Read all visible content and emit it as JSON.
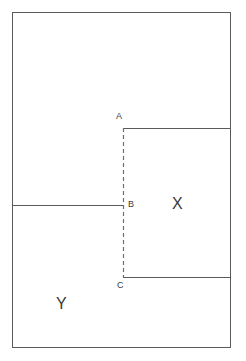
{
  "figure": {
    "canvas": {
      "width": 246,
      "height": 361
    },
    "colors": {
      "stroke": "#5a5a5a",
      "dashed_stroke": "#6e6e6e",
      "text": "#3a3a3a",
      "background": "#ffffff"
    },
    "outer_rect": {
      "x": 12,
      "y": 12,
      "width": 219,
      "height": 336
    },
    "lines": [
      {
        "name": "top-of-x",
        "x1": 123,
        "y1": 128,
        "x2": 231,
        "y2": 128,
        "style": "solid"
      },
      {
        "name": "left-divider-b",
        "x1": 12,
        "y1": 205,
        "x2": 123,
        "y2": 205,
        "style": "solid"
      },
      {
        "name": "bottom-of-x",
        "x1": 123,
        "y1": 277,
        "x2": 231,
        "y2": 277,
        "style": "solid"
      },
      {
        "name": "vertical-abc",
        "x1": 123,
        "y1": 128,
        "x2": 123,
        "y2": 277,
        "style": "dashed"
      }
    ],
    "points": [
      {
        "id": "A",
        "label": "A",
        "x": 123,
        "y": 128
      },
      {
        "id": "B",
        "label": "B",
        "x": 123,
        "y": 205
      },
      {
        "id": "C",
        "label": "C",
        "x": 123,
        "y": 277
      }
    ],
    "regions": [
      {
        "id": "X",
        "label": "X",
        "x": 178,
        "y": 205
      },
      {
        "id": "Y",
        "label": "Y",
        "x": 62,
        "y": 305
      }
    ]
  }
}
